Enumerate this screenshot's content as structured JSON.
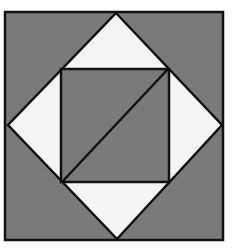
{
  "figure": {
    "colors": {
      "background": "#ffffff",
      "fill_dark": "#7a7a7a",
      "fill_light": "#f4f4f4",
      "stroke": "#111111"
    },
    "outer_square": {
      "x": 5,
      "y": 12,
      "w": 218,
      "h": 228
    },
    "diamond": {
      "points": "116,13 222,125 117,239 8,125"
    },
    "inner_square": {
      "x": 61,
      "y": 69,
      "w": 108,
      "h": 113
    },
    "diagonal": {
      "x1": 62,
      "y1": 182,
      "x2": 168,
      "y2": 69
    }
  }
}
